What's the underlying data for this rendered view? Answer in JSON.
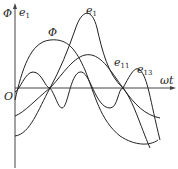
{
  "diagram": {
    "y_axis_label": "Φ",
    "y_axis_label2": "e",
    "y_axis_label2_sub": "1",
    "x_axis_label": "ωt",
    "origin_label": "O",
    "curves": [
      {
        "name": "Φ",
        "label": "Φ",
        "sub": ""
      },
      {
        "name": "e1",
        "label": "e",
        "sub": "1"
      },
      {
        "name": "e11",
        "label": "e",
        "sub": "11"
      },
      {
        "name": "e13",
        "label": "e",
        "sub": "13"
      }
    ],
    "colors": {
      "stroke": "#222222",
      "background": "#ffffff"
    }
  }
}
